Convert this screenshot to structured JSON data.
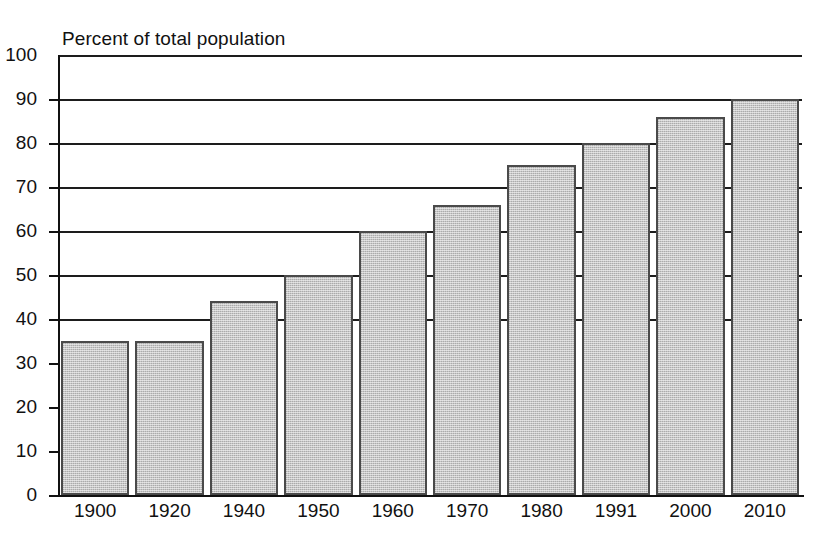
{
  "chart_data": {
    "type": "bar",
    "title": "Percent of total population",
    "subtitle": "",
    "xlabel": "",
    "ylabel": "",
    "categories": [
      "1900",
      "1920",
      "1940",
      "1950",
      "1960",
      "1970",
      "1980",
      "1991",
      "2000",
      "2010"
    ],
    "values": [
      35,
      35,
      44,
      50,
      60,
      66,
      75,
      80,
      86,
      90
    ],
    "ylim": [
      0,
      100
    ],
    "xlim_note": "categorical",
    "yticks": [
      0,
      10,
      20,
      30,
      40,
      50,
      60,
      70,
      80,
      90,
      100
    ],
    "ytick_labels": [
      "0",
      "10",
      "20",
      "30",
      "40",
      "50",
      "60",
      "70",
      "80",
      "90",
      "100"
    ],
    "grid": "horizontal gridlines at every 10 units from 40 to 100; tick marks only below 40",
    "gridline_levels": [
      40,
      50,
      60,
      70,
      80,
      90,
      100
    ],
    "tickmark_levels": [
      0,
      10,
      20,
      30
    ],
    "legend": "none",
    "legend_position": "none",
    "annotations": [],
    "bar_fill_color": "#c6c6c6",
    "bar_edge_color": "#4a4a4a",
    "axis_color": "#111111",
    "background_color": "#ffffff"
  }
}
